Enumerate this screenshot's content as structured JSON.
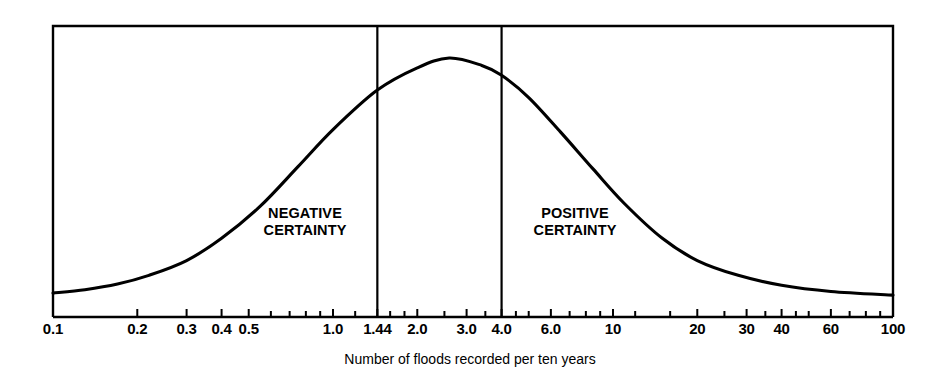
{
  "chart_data": {
    "type": "line",
    "title": "",
    "xlabel": "Number of floods recorded per ten years",
    "ylabel": "",
    "xscale": "log",
    "xlim": [
      0.1,
      100
    ],
    "ylim": [
      0,
      1
    ],
    "grid": false,
    "legend": null,
    "x_tick_labels": [
      "0.1",
      "0.2",
      "0.3",
      "0.4",
      "0.5",
      "1.0",
      "1.44",
      "2.0",
      "3.0",
      "4.0",
      "6.0",
      "10",
      "20",
      "30",
      "40",
      "60",
      "100"
    ],
    "x_tick_values": [
      0.1,
      0.2,
      0.3,
      0.4,
      0.5,
      1.0,
      1.44,
      2.0,
      3.0,
      4.0,
      6.0,
      10,
      20,
      30,
      40,
      60,
      100
    ],
    "minor_tick_values": [
      0.6,
      0.7,
      0.8,
      0.9,
      1.2,
      1.6,
      1.8,
      2.5,
      3.5,
      4.5,
      5.0,
      7.0,
      8.0,
      9.0,
      12,
      16,
      25,
      35,
      45,
      50,
      70,
      80,
      90
    ],
    "series": [
      {
        "name": "certainty distribution",
        "points_x": [
          0.1,
          0.13,
          0.17,
          0.22,
          0.3,
          0.4,
          0.55,
          0.75,
          1.0,
          1.44,
          2.0,
          2.6,
          3.4,
          4.0,
          5.0,
          6.5,
          8.5,
          11,
          15,
          20,
          28,
          40,
          60,
          100
        ],
        "points_y": [
          0.048,
          0.062,
          0.085,
          0.12,
          0.18,
          0.27,
          0.4,
          0.56,
          0.71,
          0.87,
          0.96,
          1.0,
          0.97,
          0.93,
          0.84,
          0.7,
          0.55,
          0.41,
          0.27,
          0.18,
          0.12,
          0.08,
          0.055,
          0.04
        ]
      }
    ],
    "dividers": [
      {
        "value": 1.44,
        "label": "1.44"
      },
      {
        "value": 4.0,
        "label": "4.0"
      }
    ],
    "regions": [
      {
        "name": "negative-certainty",
        "line1": "NEGATIVE",
        "line2": "CERTAINTY"
      },
      {
        "name": "positive-certainty",
        "line1": "POSITIVE",
        "line2": "CERTAINTY"
      }
    ],
    "colors": {
      "curve": "#000000",
      "frame": "#000000",
      "divider": "#000000",
      "background": "#ffffff",
      "text": "#000000"
    }
  }
}
